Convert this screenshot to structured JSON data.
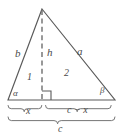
{
  "figure": {
    "kind": "geometry-diagram",
    "colors": {
      "stroke": "#5a5a5a",
      "dashed_stroke": "#6e6e6e",
      "brace_stroke": "#6e6e6e",
      "label_text": "#4a4a4a",
      "background": "#ffffff"
    },
    "geometry": {
      "apex": {
        "x": 42,
        "y": 9
      },
      "base_left": {
        "x": 8,
        "y": 100
      },
      "base_right": {
        "x": 115,
        "y": 100
      },
      "foot_of_altitude": {
        "x": 42,
        "y": 100
      },
      "right_angle_marker_size": 9
    }
  },
  "labels": {
    "side_left": "b",
    "altitude": "h",
    "side_right": "a",
    "region_left": "1",
    "region_right": "2",
    "angle_left": "α",
    "angle_right": "β",
    "segment_left": "x",
    "segment_right": "c − x",
    "base_total": "c"
  },
  "label_positions": {
    "side_left": {
      "x": 15,
      "y": 48
    },
    "altitude": {
      "x": 47,
      "y": 47
    },
    "side_right": {
      "x": 77,
      "y": 46
    },
    "region_left": {
      "x": 27,
      "y": 72
    },
    "region_right": {
      "x": 64,
      "y": 68
    },
    "angle_left": {
      "x": 13,
      "y": 89
    },
    "angle_right": {
      "x": 100,
      "y": 86
    },
    "segment_left": {
      "x": 26,
      "y": 106
    },
    "segment_right": {
      "x": 67,
      "y": 105
    },
    "base_total": {
      "x": 58,
      "y": 124
    }
  }
}
